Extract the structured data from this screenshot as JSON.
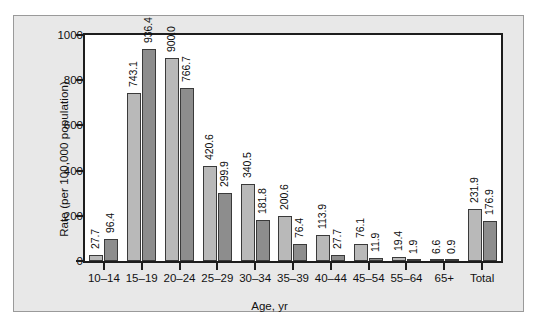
{
  "chart_data": {
    "type": "bar",
    "title": "",
    "xlabel": "Age, yr",
    "ylabel": "Rate (per 100,000 population)",
    "ylim": [
      0,
      1000
    ],
    "yticks": [
      0,
      200,
      400,
      600,
      800,
      1000
    ],
    "grid": false,
    "legend_position": "top-right",
    "categories": [
      "10–14",
      "15–19",
      "20–24",
      "25–29",
      "30–34",
      "35–39",
      "40–44",
      "45–54",
      "55–64",
      "65+",
      "Total"
    ],
    "series": [
      {
        "name": "Men",
        "color": "#b9b9b9",
        "values": [
          27.7,
          743.1,
          900.0,
          420.6,
          340.5,
          200.6,
          113.9,
          76.1,
          19.4,
          6.6,
          231.9
        ],
        "labels": [
          "27.7",
          "743.1",
          "900.0",
          "420.6",
          "340.5",
          "200.6",
          "113.9",
          "76.1",
          "19.4",
          "6.6",
          "231.9"
        ]
      },
      {
        "name": "Women",
        "color": "#8d8d8d",
        "values": [
          96.4,
          936.4,
          766.7,
          299.9,
          181.8,
          76.4,
          27.7,
          11.9,
          1.9,
          0.9,
          176.9
        ],
        "labels": [
          "96.4",
          "936.4",
          "766.7",
          "299.9",
          "181.8",
          "76.4",
          "27.7",
          "11.9",
          "1.9",
          "0.9",
          "176.9"
        ]
      }
    ]
  },
  "legend": {
    "items": [
      {
        "label": "Men",
        "color": "#b9b9b9"
      },
      {
        "label": "Women",
        "color": "#8d8d8d"
      }
    ]
  }
}
